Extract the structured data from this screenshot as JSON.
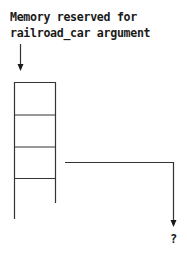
{
  "diagram": {
    "label_line1": "Memory reserved for",
    "label_line2": "railroad_car argument",
    "unknown_target_label": "?",
    "memory_cells": 4,
    "colors": {
      "stroke": "#333333",
      "text": "#1a1a1a",
      "background": "#ffffff"
    }
  }
}
